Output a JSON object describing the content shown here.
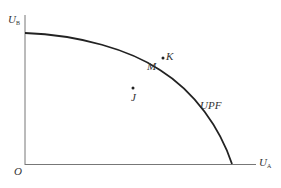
{
  "diagram": {
    "axes": {
      "y_label": "U",
      "y_sub": "B",
      "x_label": "U",
      "x_sub": "A",
      "origin": "O"
    },
    "curve_label": "UPF",
    "points": [
      {
        "id": "J",
        "label": "J",
        "position": "inside frontier"
      },
      {
        "id": "M",
        "label": "M",
        "position": "on frontier"
      },
      {
        "id": "K",
        "label": "K",
        "position": "outside frontier"
      }
    ],
    "colors": {
      "axis": "#777777",
      "curve": "#222222",
      "text": "#333333"
    }
  }
}
